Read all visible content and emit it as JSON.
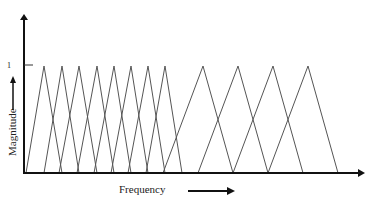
{
  "diagram": {
    "type": "triangular-filter-bank",
    "y_axis": {
      "label": "Magnitude",
      "tick_label": "1"
    },
    "x_axis": {
      "label": "Frequency"
    },
    "colors": {
      "axis": "#111111",
      "filters": "#555555",
      "text": "#222222"
    },
    "filters": {
      "narrow": [
        {
          "left": 26,
          "peak": 44,
          "right": 62
        },
        {
          "left": 44,
          "peak": 62,
          "right": 79
        },
        {
          "left": 59,
          "peak": 79,
          "right": 97
        },
        {
          "left": 77,
          "peak": 97,
          "right": 114
        },
        {
          "left": 94,
          "peak": 114,
          "right": 131
        },
        {
          "left": 111,
          "peak": 131,
          "right": 148
        },
        {
          "left": 128,
          "peak": 148,
          "right": 165
        },
        {
          "left": 146,
          "peak": 165,
          "right": 182
        }
      ],
      "wide": [
        {
          "left": 163,
          "peak": 203,
          "right": 233
        },
        {
          "left": 198,
          "peak": 238,
          "right": 268
        },
        {
          "left": 233,
          "peak": 273,
          "right": 303
        },
        {
          "left": 268,
          "peak": 308,
          "right": 338
        }
      ]
    }
  }
}
